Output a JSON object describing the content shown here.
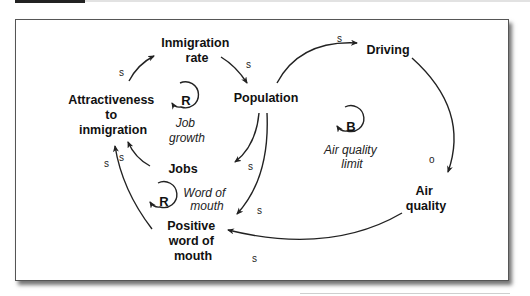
{
  "diagram": {
    "type": "causal-loop-diagram",
    "nodes": {
      "immigration_rate": [
        "Inmigration",
        "rate"
      ],
      "population": [
        "Population"
      ],
      "driving": [
        "Driving"
      ],
      "air_quality": [
        "Air",
        "quality"
      ],
      "attractiveness": [
        "Attractiveness",
        "to",
        "inmigration"
      ],
      "jobs": [
        "Jobs"
      ],
      "positive_wom": [
        "Positive",
        "word of",
        "mouth"
      ]
    },
    "loops": {
      "job_growth": {
        "letter": "R",
        "name": [
          "Job",
          "growth"
        ]
      },
      "air_quality_limit": {
        "letter": "B",
        "name": [
          "Air quality",
          "limit"
        ]
      },
      "word_of_mouth": {
        "letter": "R",
        "name": [
          "Word of",
          "mouth"
        ]
      }
    },
    "links": [
      {
        "from": "Attractiveness to inmigration",
        "to": "Inmigration rate",
        "polarity": "s"
      },
      {
        "from": "Inmigration rate",
        "to": "Population",
        "polarity": "s"
      },
      {
        "from": "Population",
        "to": "Driving",
        "polarity": "s"
      },
      {
        "from": "Driving",
        "to": "Air quality",
        "polarity": "o"
      },
      {
        "from": "Air quality",
        "to": "Positive word of mouth",
        "polarity": "s"
      },
      {
        "from": "Population",
        "to": "Jobs",
        "polarity": "s"
      },
      {
        "from": "Population",
        "to": "Positive word of mouth",
        "polarity": "s"
      },
      {
        "from": "Jobs",
        "to": "Attractiveness to inmigration",
        "polarity": "s"
      },
      {
        "from": "Positive word of mouth",
        "to": "Attractiveness to inmigration",
        "polarity": "s"
      }
    ]
  }
}
